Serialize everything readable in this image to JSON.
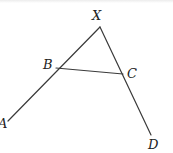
{
  "figure": {
    "type": "geometry-diagram",
    "points": {
      "X": {
        "label": "X",
        "x": 100,
        "y": 27,
        "label_x": 92,
        "label_y": 20
      },
      "B": {
        "label": "B",
        "x": 56,
        "y": 68,
        "label_x": 43,
        "label_y": 69
      },
      "C": {
        "label": "C",
        "x": 123,
        "y": 74,
        "label_x": 127,
        "label_y": 78
      },
      "A": {
        "label": "A",
        "x": 8,
        "y": 121,
        "label_x": -2,
        "label_y": 128
      },
      "D": {
        "label": "D",
        "x": 151,
        "y": 135,
        "label_x": 148,
        "label_y": 149
      }
    },
    "segments": [
      {
        "from": "X",
        "to": "A"
      },
      {
        "from": "X",
        "to": "D"
      },
      {
        "from": "B",
        "to": "C"
      }
    ],
    "line_color": "#3a3a3a"
  }
}
